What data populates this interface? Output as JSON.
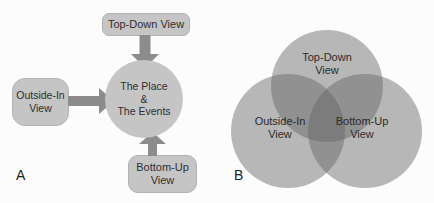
{
  "figure": {
    "type": "diagram"
  },
  "panel_a": {
    "label": "A",
    "boxes": {
      "top": {
        "label": "Top-Down View"
      },
      "left": {
        "label": "Outside-In\nView"
      },
      "bottom": {
        "label": "Bottom-Up\nView"
      }
    },
    "center": {
      "text": "The Place\n&\nThe Events"
    },
    "arrows": [
      {
        "name": "top-down-arrow",
        "direction": "down",
        "from": "Top-Down View",
        "to": "The Place & The Events"
      },
      {
        "name": "outside-in-arrow",
        "direction": "right",
        "from": "Outside-In View",
        "to": "The Place & The Events"
      },
      {
        "name": "bottom-up-arrow",
        "direction": "up",
        "from": "Bottom-Up View",
        "to": "The Place & The Events"
      }
    ]
  },
  "panel_b": {
    "label": "B",
    "circles": {
      "top": {
        "label": "Top-Down\nView"
      },
      "left": {
        "label": "Outside-In\nView"
      },
      "right": {
        "label": "Bottom-Up\nView"
      }
    }
  },
  "colors": {
    "background": "#fcfcfc",
    "shape_fill": "#c5c5c5",
    "arrow_fill": "#8c8c8c",
    "venn_circle": "rgba(100,100,100,0.45)",
    "text": "#2e2e2e"
  }
}
